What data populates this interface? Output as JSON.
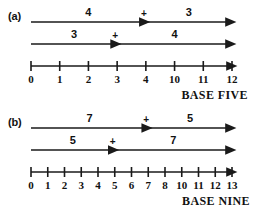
{
  "figure": {
    "stroke_color": "#1a1a1a",
    "background": "#ffffff"
  },
  "panels": [
    {
      "id": "a",
      "part_label": "(a)",
      "base_label": "BASE FIVE",
      "axis": {
        "ticks": [
          "0",
          "1",
          "2",
          "3",
          "4",
          "10",
          "11",
          "12"
        ],
        "tick_values": [
          0,
          1,
          2,
          3,
          4,
          5,
          6,
          7
        ],
        "min": 0,
        "max": 7,
        "end_label": "12"
      },
      "rows": [
        {
          "first_addend": "4",
          "plus": "+",
          "second_addend": "3",
          "break_at": 4,
          "end_at": 7
        },
        {
          "first_addend": "3",
          "plus": "+",
          "second_addend": "4",
          "break_at": 3,
          "end_at": 7
        }
      ]
    },
    {
      "id": "b",
      "part_label": "(b)",
      "base_label": "BASE NINE",
      "axis": {
        "ticks": [
          "0",
          "1",
          "2",
          "3",
          "4",
          "5",
          "6",
          "7",
          "8",
          "10",
          "11",
          "12",
          "13"
        ],
        "tick_values": [
          0,
          1,
          2,
          3,
          4,
          5,
          6,
          7,
          8,
          9,
          10,
          11,
          12
        ],
        "min": 0,
        "max": 12,
        "end_label": "13"
      },
      "rows": [
        {
          "first_addend": "7",
          "plus": "+",
          "second_addend": "5",
          "break_at": 7,
          "end_at": 12
        },
        {
          "first_addend": "5",
          "plus": "+",
          "second_addend": "7",
          "break_at": 5,
          "end_at": 12
        }
      ]
    }
  ],
  "chart_data": {
    "type": "diagram",
    "panels": [
      {
        "label": "(a)",
        "base": "BASE FIVE",
        "axis_tick_labels": [
          "0",
          "1",
          "2",
          "3",
          "4",
          "10",
          "11",
          "12"
        ],
        "equations": [
          "4 + 3 = 12",
          "3 + 4 = 12"
        ]
      },
      {
        "label": "(b)",
        "base": "BASE NINE",
        "axis_tick_labels": [
          "0",
          "1",
          "2",
          "3",
          "4",
          "5",
          "6",
          "7",
          "8",
          "10",
          "11",
          "12",
          "13"
        ],
        "equations": [
          "7 + 5 = 13",
          "5 + 7 = 13"
        ]
      }
    ]
  }
}
